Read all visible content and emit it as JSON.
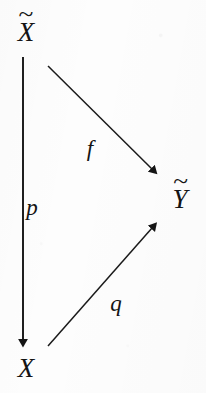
{
  "figure": {
    "type": "commutative-diagram",
    "shape": "triangle",
    "background_color": "#fdfdfd",
    "ink_color": "#141414",
    "width": 206,
    "height": 393
  },
  "nodes": [
    {
      "id": "x-tilde",
      "base": "X",
      "accent": "~",
      "label": "X̃",
      "position": {
        "x": 26,
        "y": 31
      }
    },
    {
      "id": "x",
      "base": "X",
      "accent": "",
      "label": "X",
      "position": {
        "x": 26,
        "y": 368
      }
    },
    {
      "id": "y-tilde",
      "base": "Y",
      "accent": "~",
      "label": "Ỹ",
      "position": {
        "x": 180,
        "y": 198
      }
    }
  ],
  "edges": [
    {
      "id": "p",
      "label": "p",
      "from": "x-tilde",
      "to": "x",
      "direction": "down",
      "start": {
        "x": 23,
        "y": 57
      },
      "end": {
        "x": 23,
        "y": 346
      },
      "label_position": {
        "x": 32,
        "y": 207
      }
    },
    {
      "id": "f",
      "label": "f",
      "from": "x-tilde",
      "to": "y-tilde",
      "direction": "down-right",
      "start": {
        "x": 48,
        "y": 66
      },
      "end": {
        "x": 159,
        "y": 176
      },
      "label_position": {
        "x": 90,
        "y": 148
      }
    },
    {
      "id": "q",
      "label": "q",
      "from": "x",
      "to": "y-tilde",
      "direction": "up-right",
      "start": {
        "x": 48,
        "y": 346
      },
      "end": {
        "x": 159,
        "y": 221
      },
      "label_position": {
        "x": 116,
        "y": 303
      }
    }
  ],
  "style": {
    "stroke_width": 1.6,
    "arrowhead": "solid-triangle",
    "node_font_size": 27,
    "label_font_size": 23
  }
}
